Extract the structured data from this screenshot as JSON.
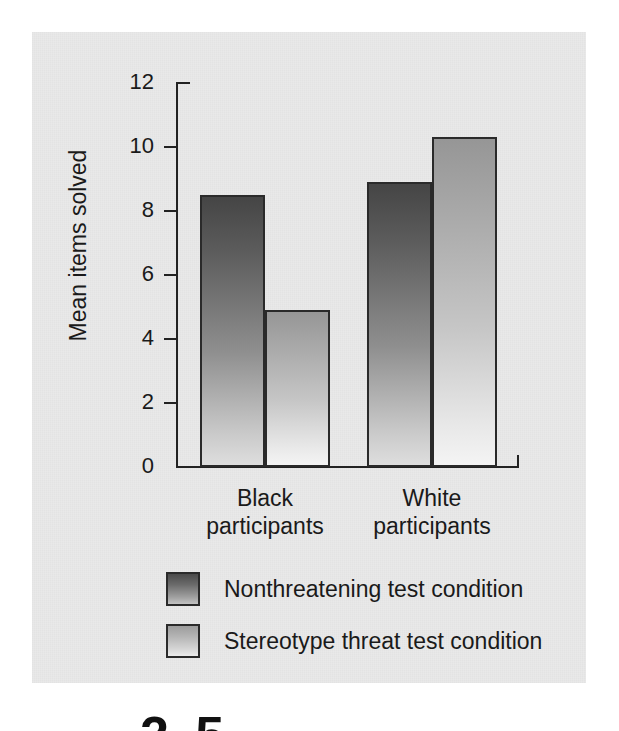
{
  "chart_data": {
    "type": "bar",
    "title": "",
    "subtitle": "",
    "xlabel": "",
    "ylabel": "Mean items solved",
    "ylim": [
      0,
      12
    ],
    "yticks": [
      0,
      2,
      4,
      6,
      8,
      10,
      12
    ],
    "ytick_labels": [
      "0",
      "2",
      "4",
      "6",
      "8",
      "10",
      "12"
    ],
    "grid": false,
    "legend_position": "below-plot",
    "categories": [
      "Black participants",
      "White participants"
    ],
    "category_lines": [
      [
        "Black",
        "participants"
      ],
      [
        "White",
        "participants"
      ]
    ],
    "series": [
      {
        "name": "Nonthreatening test condition",
        "values": [
          8.5,
          8.9
        ],
        "color_top": "#454545",
        "color_bottom": "#dedede"
      },
      {
        "name": "Stereotype threat test condition",
        "values": [
          4.9,
          10.3
        ],
        "color_top": "#969696",
        "color_bottom": "#f4f4f4"
      }
    ]
  },
  "figure": {
    "panel_background": "#e9e9e9",
    "axis_color": "#222222",
    "text_color": "#1a1a1a"
  },
  "legend": {
    "items": [
      {
        "label": "Nonthreatening test condition",
        "swatch": "dark"
      },
      {
        "label": "Stereotype threat test condition",
        "swatch": "light"
      }
    ]
  },
  "page_fragment": {
    "text": "2.5"
  }
}
